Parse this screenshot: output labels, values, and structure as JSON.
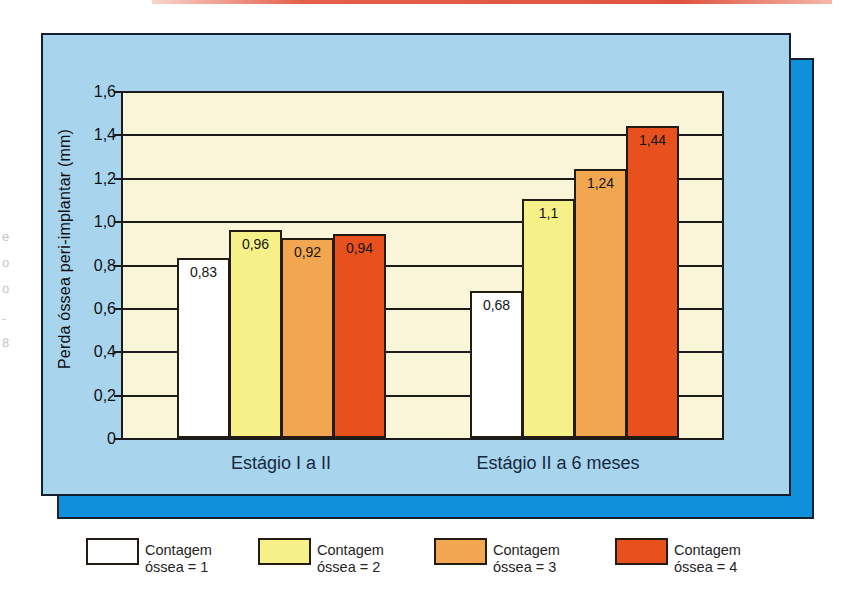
{
  "page": {
    "top_rule_color": "#e05a45",
    "background": "#ffffff",
    "edge_marks": [
      "e",
      "o",
      "o",
      "-",
      "8"
    ]
  },
  "panels": {
    "back_color": "#0f90da",
    "front_color": "#a8d4ee",
    "border_color": "#15202d"
  },
  "chart_data": {
    "type": "bar",
    "title": "",
    "xlabel": "",
    "ylabel": "Perda óssea peri-implantar (mm)",
    "ylim": [
      0,
      1.6
    ],
    "grid": "horizontal",
    "plot_bg": "#f9f5d8",
    "legend_position": "bottom",
    "yticks": [
      {
        "value": 1.6,
        "label": "1,6"
      },
      {
        "value": 1.4,
        "label": "1,4"
      },
      {
        "value": 1.2,
        "label": "1,2"
      },
      {
        "value": 1.0,
        "label": "1,0"
      },
      {
        "value": 0.8,
        "label": "0,8"
      },
      {
        "value": 0.6,
        "label": "0,6"
      },
      {
        "value": 0.4,
        "label": "0,4"
      },
      {
        "value": 0.2,
        "label": "0,2"
      },
      {
        "value": 0.0,
        "label": "0"
      }
    ],
    "categories": [
      "Estágio I a II",
      "Estágio II a 6 meses"
    ],
    "series": [
      {
        "name": "Contagem óssea = 1",
        "legend_lines": [
          "Contagem",
          "óssea = 1"
        ],
        "color": "#ffffff",
        "values": [
          0.83,
          0.68
        ],
        "value_labels": [
          "0,83",
          "0,68"
        ]
      },
      {
        "name": "Contagem óssea = 2",
        "legend_lines": [
          "Contagem",
          "óssea = 2"
        ],
        "color": "#f5f188",
        "values": [
          0.96,
          1.1
        ],
        "value_labels": [
          "0,96",
          "1,1"
        ]
      },
      {
        "name": "Contagem óssea = 3",
        "legend_lines": [
          "Contagem",
          "óssea = 3"
        ],
        "color": "#f1a64f",
        "values": [
          0.92,
          1.24
        ],
        "value_labels": [
          "0,92",
          "1,24"
        ]
      },
      {
        "name": "Contagem óssea = 4",
        "legend_lines": [
          "Contagem",
          "óssea = 4"
        ],
        "color": "#e8511d",
        "values": [
          0.94,
          1.44
        ],
        "value_labels": [
          "0,94",
          "1,44"
        ]
      }
    ]
  }
}
